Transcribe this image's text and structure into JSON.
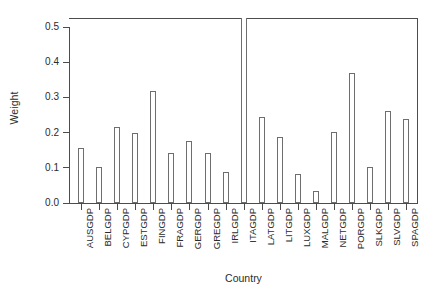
{
  "chart_data": {
    "type": "bar",
    "title": "",
    "xlabel": "Country",
    "ylabel": "Weight",
    "categories": [
      "AUSGDP",
      "BELGDP",
      "CYPGDP",
      "ESTGDP",
      "FINGDP",
      "FRAGDP",
      "GERGDP",
      "GREGDP",
      "IRLGDP",
      "ITAGDP",
      "LATGDP",
      "LITGDP",
      "LUXGDP",
      "MALGDP",
      "NETGDP",
      "PORGDP",
      "SLKGDP",
      "SLVGDP",
      "SPAGDP"
    ],
    "values": [
      0.156,
      0.103,
      0.217,
      0.198,
      0.318,
      0.141,
      0.177,
      0.141,
      0.088,
      0.545,
      0.245,
      0.187,
      0.082,
      0.033,
      0.203,
      0.369,
      0.102,
      0.262,
      0.24
    ],
    "ylim": [
      0.0,
      0.545
    ],
    "yticks": [
      0.0,
      0.1,
      0.2,
      0.3,
      0.4,
      0.5
    ],
    "ytick_labels": [
      "0.0",
      "0.1",
      "0.2",
      "0.3",
      "0.4",
      "0.5"
    ],
    "grid": false,
    "legend": "none",
    "bar_fill_color": "#ffffff",
    "bar_border_color": "#6e6e6e",
    "axis_color": "#4c4c4c"
  }
}
